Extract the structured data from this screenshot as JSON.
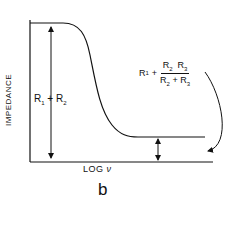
{
  "figure": {
    "panel_label": "b",
    "y_axis_label": "IMPEDANCE",
    "x_axis_label_text": "LOG",
    "x_axis_label_symbol": "ν",
    "high_freq_label": {
      "lhs": "R",
      "lhs_sub": "1",
      "plus": "+",
      "num_a": "R",
      "num_a_sub": "2",
      "num_b": "R",
      "num_b_sub": "3",
      "den_a": "R",
      "den_a_sub": "2",
      "den_plus": "+",
      "den_b": "R",
      "den_b_sub": "3"
    },
    "low_freq_label": {
      "a": "R",
      "a_sub": "1",
      "plus": "+",
      "b": "R",
      "b_sub": "2"
    },
    "line_color": "#111111"
  }
}
